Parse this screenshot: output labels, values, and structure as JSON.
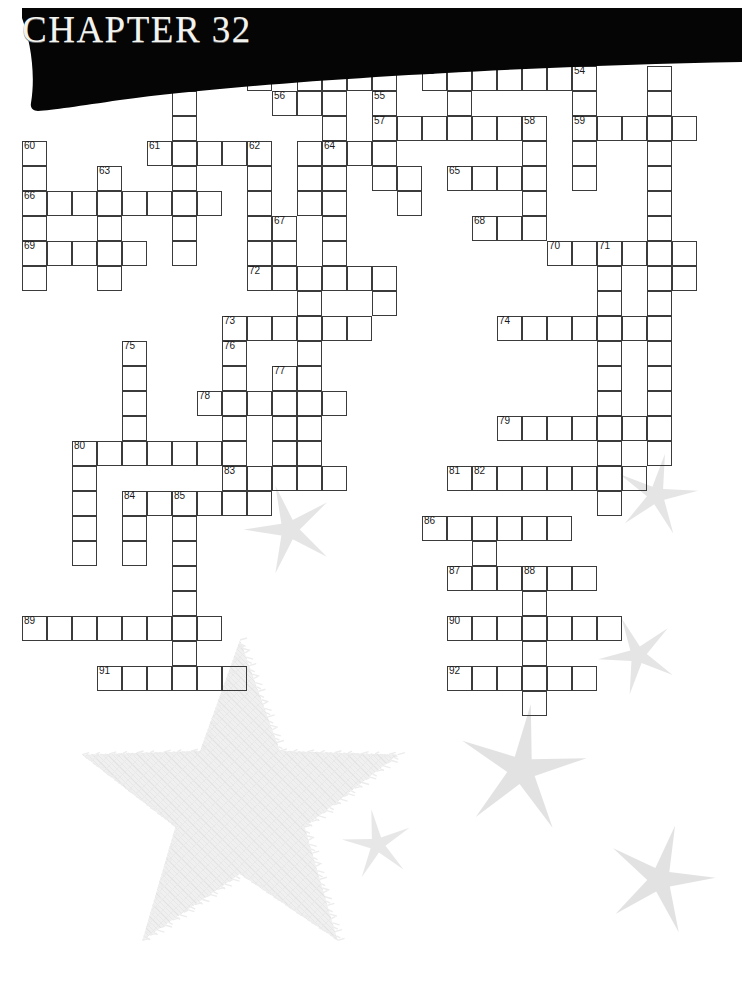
{
  "page": {
    "width": 742,
    "height": 996,
    "background": "#ffffff",
    "ink_color": "#3b3b3b",
    "banner_color": "#050505",
    "title_color": "#f2f2ee",
    "star_color": "#d0d0d0",
    "bigstar_color": "#f0f0f0"
  },
  "header": {
    "chapter_title": "CHAPTER 32"
  },
  "crossword": {
    "cell_size": 25,
    "origin_x": 22,
    "origin_y": 16,
    "numbers_visible": [
      53,
      54,
      55,
      56,
      57,
      58,
      59,
      60,
      61,
      62,
      63,
      64,
      65,
      66,
      67,
      68,
      69,
      70,
      71,
      72,
      73,
      74,
      75,
      76,
      77,
      78,
      79,
      80,
      81,
      82,
      83,
      84,
      85,
      86,
      87,
      88,
      89,
      90,
      91,
      92
    ],
    "cells": [
      {
        "c": 6,
        "r": 2
      },
      {
        "c": 6,
        "r": 3
      },
      {
        "c": 6,
        "r": 4
      },
      {
        "c": 9,
        "r": 2
      },
      {
        "c": 11,
        "r": 2
      },
      {
        "c": 12,
        "r": 2
      },
      {
        "c": 13,
        "r": 2
      },
      {
        "c": 14,
        "r": 2
      },
      {
        "c": 16,
        "r": 2,
        "n": "53"
      },
      {
        "c": 17,
        "r": 2
      },
      {
        "c": 18,
        "r": 2
      },
      {
        "c": 19,
        "r": 2
      },
      {
        "c": 20,
        "r": 2
      },
      {
        "c": 21,
        "r": 2
      },
      {
        "c": 22,
        "r": 2,
        "n": "54"
      },
      {
        "c": 25,
        "r": 2
      },
      {
        "c": 25,
        "r": 3
      },
      {
        "c": 25,
        "r": 4
      },
      {
        "c": 10,
        "r": 3,
        "n": "56"
      },
      {
        "c": 11,
        "r": 3
      },
      {
        "c": 12,
        "r": 3
      },
      {
        "c": 14,
        "r": 3,
        "n": "55"
      },
      {
        "c": 17,
        "r": 3
      },
      {
        "c": 22,
        "r": 3
      },
      {
        "c": 14,
        "r": 4,
        "n": "57"
      },
      {
        "c": 15,
        "r": 4
      },
      {
        "c": 16,
        "r": 4
      },
      {
        "c": 17,
        "r": 4
      },
      {
        "c": 18,
        "r": 4
      },
      {
        "c": 19,
        "r": 4
      },
      {
        "c": 20,
        "r": 4,
        "n": "58"
      },
      {
        "c": 22,
        "r": 4,
        "n": "59"
      },
      {
        "c": 23,
        "r": 4
      },
      {
        "c": 24,
        "r": 4
      },
      {
        "c": 25,
        "r": 4
      },
      {
        "c": 26,
        "r": 4
      },
      {
        "c": 12,
        "r": 4
      },
      {
        "c": 0,
        "r": 5,
        "n": "60"
      },
      {
        "c": 5,
        "r": 5,
        "n": "61"
      },
      {
        "c": 6,
        "r": 5
      },
      {
        "c": 7,
        "r": 5
      },
      {
        "c": 8,
        "r": 5
      },
      {
        "c": 9,
        "r": 5,
        "n": "62"
      },
      {
        "c": 12,
        "r": 5,
        "n": "64"
      },
      {
        "c": 13,
        "r": 5
      },
      {
        "c": 14,
        "r": 5
      },
      {
        "c": 20,
        "r": 5
      },
      {
        "c": 22,
        "r": 5
      },
      {
        "c": 25,
        "r": 5
      },
      {
        "c": 11,
        "r": 5
      },
      {
        "c": 0,
        "r": 6
      },
      {
        "c": 3,
        "r": 6,
        "n": "63"
      },
      {
        "c": 6,
        "r": 6
      },
      {
        "c": 9,
        "r": 6
      },
      {
        "c": 12,
        "r": 6
      },
      {
        "c": 14,
        "r": 6
      },
      {
        "c": 15,
        "r": 6
      },
      {
        "c": 17,
        "r": 6,
        "n": "65"
      },
      {
        "c": 18,
        "r": 6
      },
      {
        "c": 19,
        "r": 6
      },
      {
        "c": 20,
        "r": 6
      },
      {
        "c": 22,
        "r": 6
      },
      {
        "c": 25,
        "r": 6
      },
      {
        "c": 11,
        "r": 6
      },
      {
        "c": 0,
        "r": 7,
        "n": "66"
      },
      {
        "c": 1,
        "r": 7
      },
      {
        "c": 2,
        "r": 7
      },
      {
        "c": 3,
        "r": 7
      },
      {
        "c": 4,
        "r": 7
      },
      {
        "c": 5,
        "r": 7
      },
      {
        "c": 6,
        "r": 7
      },
      {
        "c": 7,
        "r": 7
      },
      {
        "c": 9,
        "r": 7
      },
      {
        "c": 12,
        "r": 7
      },
      {
        "c": 15,
        "r": 7
      },
      {
        "c": 20,
        "r": 7
      },
      {
        "c": 25,
        "r": 7
      },
      {
        "c": 11,
        "r": 7
      },
      {
        "c": 0,
        "r": 8
      },
      {
        "c": 3,
        "r": 8
      },
      {
        "c": 6,
        "r": 8
      },
      {
        "c": 9,
        "r": 8
      },
      {
        "c": 10,
        "r": 8,
        "n": "67"
      },
      {
        "c": 12,
        "r": 8
      },
      {
        "c": 18,
        "r": 8,
        "n": "68"
      },
      {
        "c": 19,
        "r": 8
      },
      {
        "c": 20,
        "r": 8
      },
      {
        "c": 25,
        "r": 8
      },
      {
        "c": 0,
        "r": 9,
        "n": "69"
      },
      {
        "c": 1,
        "r": 9
      },
      {
        "c": 2,
        "r": 9
      },
      {
        "c": 3,
        "r": 9
      },
      {
        "c": 4,
        "r": 9
      },
      {
        "c": 6,
        "r": 9
      },
      {
        "c": 9,
        "r": 9
      },
      {
        "c": 10,
        "r": 9
      },
      {
        "c": 12,
        "r": 9
      },
      {
        "c": 21,
        "r": 9,
        "n": "70"
      },
      {
        "c": 22,
        "r": 9
      },
      {
        "c": 23,
        "r": 9,
        "n": "71"
      },
      {
        "c": 24,
        "r": 9
      },
      {
        "c": 25,
        "r": 9
      },
      {
        "c": 26,
        "r": 9
      },
      {
        "c": 0,
        "r": 10
      },
      {
        "c": 3,
        "r": 10
      },
      {
        "c": 9,
        "r": 10,
        "n": "72"
      },
      {
        "c": 10,
        "r": 10
      },
      {
        "c": 11,
        "r": 10
      },
      {
        "c": 12,
        "r": 10
      },
      {
        "c": 13,
        "r": 10
      },
      {
        "c": 14,
        "r": 10
      },
      {
        "c": 23,
        "r": 10
      },
      {
        "c": 25,
        "r": 10
      },
      {
        "c": 26,
        "r": 10
      },
      {
        "c": 11,
        "r": 11
      },
      {
        "c": 14,
        "r": 11
      },
      {
        "c": 23,
        "r": 11
      },
      {
        "c": 25,
        "r": 11
      },
      {
        "c": 8,
        "r": 12,
        "n": "73"
      },
      {
        "c": 9,
        "r": 12
      },
      {
        "c": 10,
        "r": 12
      },
      {
        "c": 11,
        "r": 12
      },
      {
        "c": 12,
        "r": 12
      },
      {
        "c": 13,
        "r": 12
      },
      {
        "c": 19,
        "r": 12,
        "n": "74"
      },
      {
        "c": 20,
        "r": 12
      },
      {
        "c": 21,
        "r": 12
      },
      {
        "c": 22,
        "r": 12
      },
      {
        "c": 23,
        "r": 12
      },
      {
        "c": 24,
        "r": 12
      },
      {
        "c": 25,
        "r": 12
      },
      {
        "c": 11,
        "r": 13
      },
      {
        "c": 23,
        "r": 13
      },
      {
        "c": 25,
        "r": 13
      },
      {
        "c": 4,
        "r": 13,
        "n": "75"
      },
      {
        "c": 8,
        "r": 13,
        "n": "76"
      },
      {
        "c": 4,
        "r": 14
      },
      {
        "c": 8,
        "r": 14
      },
      {
        "c": 10,
        "r": 14,
        "n": "77"
      },
      {
        "c": 11,
        "r": 14
      },
      {
        "c": 23,
        "r": 14
      },
      {
        "c": 25,
        "r": 14
      },
      {
        "c": 4,
        "r": 15
      },
      {
        "c": 7,
        "r": 15,
        "n": "78"
      },
      {
        "c": 8,
        "r": 15
      },
      {
        "c": 9,
        "r": 15
      },
      {
        "c": 10,
        "r": 15
      },
      {
        "c": 11,
        "r": 15
      },
      {
        "c": 12,
        "r": 15
      },
      {
        "c": 23,
        "r": 15
      },
      {
        "c": 25,
        "r": 15
      },
      {
        "c": 4,
        "r": 16
      },
      {
        "c": 8,
        "r": 16
      },
      {
        "c": 10,
        "r": 16
      },
      {
        "c": 11,
        "r": 16
      },
      {
        "c": 19,
        "r": 16,
        "n": "79"
      },
      {
        "c": 20,
        "r": 16
      },
      {
        "c": 21,
        "r": 16
      },
      {
        "c": 22,
        "r": 16
      },
      {
        "c": 23,
        "r": 16
      },
      {
        "c": 24,
        "r": 16
      },
      {
        "c": 25,
        "r": 16
      },
      {
        "c": 2,
        "r": 17,
        "n": "80"
      },
      {
        "c": 3,
        "r": 17
      },
      {
        "c": 4,
        "r": 17
      },
      {
        "c": 5,
        "r": 17
      },
      {
        "c": 6,
        "r": 17
      },
      {
        "c": 7,
        "r": 17
      },
      {
        "c": 8,
        "r": 17
      },
      {
        "c": 10,
        "r": 17
      },
      {
        "c": 11,
        "r": 17
      },
      {
        "c": 23,
        "r": 17
      },
      {
        "c": 25,
        "r": 17
      },
      {
        "c": 2,
        "r": 18
      },
      {
        "c": 10,
        "r": 18
      },
      {
        "c": 17,
        "r": 18,
        "n": "81"
      },
      {
        "c": 18,
        "r": 18,
        "n": "82"
      },
      {
        "c": 19,
        "r": 18
      },
      {
        "c": 20,
        "r": 18
      },
      {
        "c": 21,
        "r": 18
      },
      {
        "c": 22,
        "r": 18
      },
      {
        "c": 23,
        "r": 18
      },
      {
        "c": 24,
        "r": 18
      },
      {
        "c": 8,
        "r": 18,
        "n": "83"
      },
      {
        "c": 9,
        "r": 18
      },
      {
        "c": 10,
        "r": 18
      },
      {
        "c": 11,
        "r": 18
      },
      {
        "c": 12,
        "r": 18
      },
      {
        "c": 2,
        "r": 19
      },
      {
        "c": 4,
        "r": 19,
        "n": "84"
      },
      {
        "c": 5,
        "r": 19
      },
      {
        "c": 6,
        "r": 19,
        "n": "85"
      },
      {
        "c": 7,
        "r": 19
      },
      {
        "c": 8,
        "r": 19
      },
      {
        "c": 9,
        "r": 19
      },
      {
        "c": 23,
        "r": 19
      },
      {
        "c": 2,
        "r": 20
      },
      {
        "c": 4,
        "r": 20
      },
      {
        "c": 6,
        "r": 20
      },
      {
        "c": 16,
        "r": 20,
        "n": "86"
      },
      {
        "c": 17,
        "r": 20
      },
      {
        "c": 18,
        "r": 20
      },
      {
        "c": 19,
        "r": 20
      },
      {
        "c": 20,
        "r": 20
      },
      {
        "c": 21,
        "r": 20
      },
      {
        "c": 2,
        "r": 21
      },
      {
        "c": 4,
        "r": 21
      },
      {
        "c": 6,
        "r": 21
      },
      {
        "c": 18,
        "r": 21
      },
      {
        "c": 6,
        "r": 22
      },
      {
        "c": 17,
        "r": 22,
        "n": "87"
      },
      {
        "c": 18,
        "r": 22
      },
      {
        "c": 19,
        "r": 22
      },
      {
        "c": 20,
        "r": 22,
        "n": "88"
      },
      {
        "c": 21,
        "r": 22
      },
      {
        "c": 22,
        "r": 22
      },
      {
        "c": 6,
        "r": 23
      },
      {
        "c": 20,
        "r": 23
      },
      {
        "c": 0,
        "r": 24,
        "n": "89"
      },
      {
        "c": 1,
        "r": 24
      },
      {
        "c": 2,
        "r": 24
      },
      {
        "c": 3,
        "r": 24
      },
      {
        "c": 4,
        "r": 24
      },
      {
        "c": 5,
        "r": 24
      },
      {
        "c": 6,
        "r": 24
      },
      {
        "c": 7,
        "r": 24
      },
      {
        "c": 17,
        "r": 24,
        "n": "90"
      },
      {
        "c": 18,
        "r": 24
      },
      {
        "c": 19,
        "r": 24
      },
      {
        "c": 20,
        "r": 24
      },
      {
        "c": 21,
        "r": 24
      },
      {
        "c": 22,
        "r": 24
      },
      {
        "c": 23,
        "r": 24
      },
      {
        "c": 6,
        "r": 25
      },
      {
        "c": 20,
        "r": 25
      },
      {
        "c": 3,
        "r": 26,
        "n": "91"
      },
      {
        "c": 4,
        "r": 26
      },
      {
        "c": 5,
        "r": 26
      },
      {
        "c": 6,
        "r": 26
      },
      {
        "c": 7,
        "r": 26
      },
      {
        "c": 8,
        "r": 26
      },
      {
        "c": 17,
        "r": 26,
        "n": "92"
      },
      {
        "c": 18,
        "r": 26
      },
      {
        "c": 19,
        "r": 26
      },
      {
        "c": 20,
        "r": 26
      },
      {
        "c": 21,
        "r": 26
      },
      {
        "c": 22,
        "r": 26
      },
      {
        "c": 20,
        "r": 27
      }
    ]
  },
  "decorations": {
    "stars": [
      {
        "name": "star-mid-left",
        "x": 290,
        "y": 530,
        "size": 46,
        "rotate": -18,
        "opacity": 0.55
      },
      {
        "name": "star-right-upper",
        "x": 656,
        "y": 495,
        "size": 42,
        "rotate": 12,
        "opacity": 0.55
      },
      {
        "name": "star-right-mid",
        "x": 638,
        "y": 655,
        "size": 40,
        "rotate": -24,
        "opacity": 0.55
      },
      {
        "name": "star-center-low",
        "x": 522,
        "y": 770,
        "size": 66,
        "rotate": 8,
        "opacity": 0.6
      },
      {
        "name": "star-small-low",
        "x": 378,
        "y": 845,
        "size": 36,
        "rotate": -10,
        "opacity": 0.5
      },
      {
        "name": "star-bottom-right",
        "x": 660,
        "y": 880,
        "size": 56,
        "rotate": 16,
        "opacity": 0.6
      }
    ],
    "big_star": {
      "name": "big-textured-star",
      "x": 45,
      "y": 632,
      "width": 390,
      "height": 340
    }
  }
}
